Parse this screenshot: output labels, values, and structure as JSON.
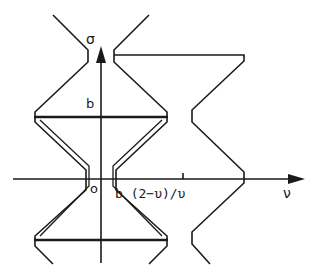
{
  "diagram": {
    "colors": {
      "ink": "#1a1a1a",
      "background": "#ffffff"
    },
    "axes": {
      "vertical_label": "σ",
      "horizontal_label": "ν",
      "origin_label": "o"
    },
    "labels": {
      "b_on_sigma": "b",
      "b_on_nu": "b (2−υ)/υ"
    }
  }
}
